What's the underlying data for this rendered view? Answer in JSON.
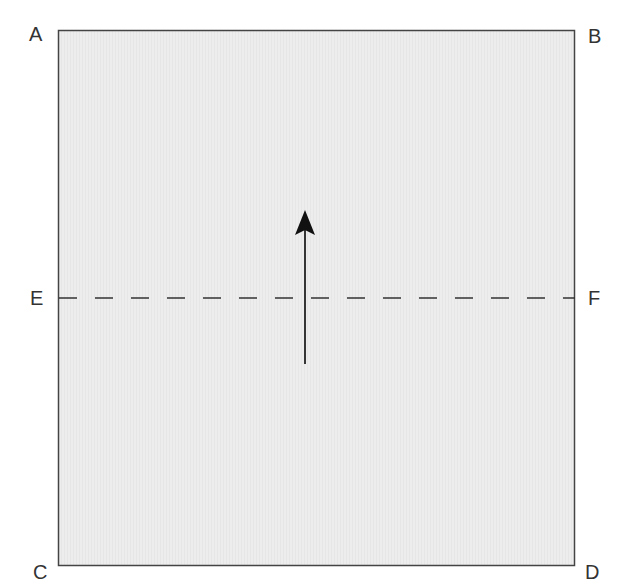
{
  "diagram": {
    "type": "folding-diagram",
    "square": {
      "x": 58,
      "y": 30,
      "width": 517,
      "height": 536,
      "fill": "#ececec",
      "stroke": "#444444"
    },
    "fold_line": {
      "from": "E",
      "to": "F",
      "style": "dashed",
      "y": 298
    },
    "arrow": {
      "direction": "up",
      "x": 305,
      "from_y": 364,
      "to_y": 210,
      "color": "#1a1a1a"
    },
    "corner_labels": {
      "A": "A",
      "B": "B",
      "C": "C",
      "D": "D",
      "E": "E",
      "F": "F"
    }
  }
}
